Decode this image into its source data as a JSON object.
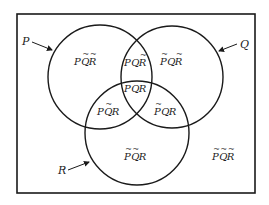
{
  "diagram": {
    "type": "venn",
    "sets": [
      {
        "key": "P",
        "label": "P"
      },
      {
        "key": "Q",
        "label": "Q"
      },
      {
        "key": "R",
        "label": "R"
      }
    ],
    "regions": [
      {
        "id": "p-only",
        "text": "PQR",
        "negated": [
          false,
          true,
          true
        ],
        "description": "P ~Q ~R"
      },
      {
        "id": "q-only",
        "text": "PQR",
        "negated": [
          true,
          false,
          true
        ],
        "description": "~P Q ~R"
      },
      {
        "id": "r-only",
        "text": "PQR",
        "negated": [
          true,
          true,
          false
        ],
        "description": "~P ~Q R"
      },
      {
        "id": "pq",
        "text": "PQR",
        "negated": [
          false,
          false,
          true
        ],
        "description": "P Q ~R"
      },
      {
        "id": "pr",
        "text": "PQR",
        "negated": [
          false,
          true,
          false
        ],
        "description": "P ~Q R"
      },
      {
        "id": "qr",
        "text": "PQR",
        "negated": [
          true,
          false,
          false
        ],
        "description": "~P Q R"
      },
      {
        "id": "pqr",
        "text": "PQR",
        "negated": [
          false,
          false,
          false
        ],
        "description": "P Q R"
      },
      {
        "id": "none",
        "text": "PQR",
        "negated": [
          true,
          true,
          true
        ],
        "description": "~P ~Q ~R"
      }
    ],
    "colors": {
      "stroke": "#1a1a1a",
      "text": "#222222",
      "background": "#ffffff"
    }
  }
}
